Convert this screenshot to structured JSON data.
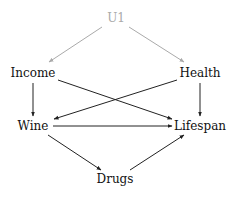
{
  "diagram": {
    "type": "causal-dag",
    "nodes": [
      {
        "id": "U1",
        "label": "U1",
        "x": 116,
        "y": 18,
        "color": "#aaaaaa",
        "latent": true
      },
      {
        "id": "Income",
        "label": "Income",
        "x": 33,
        "y": 73,
        "color": "#111111"
      },
      {
        "id": "Health",
        "label": "Health",
        "x": 200,
        "y": 73,
        "color": "#111111"
      },
      {
        "id": "Wine",
        "label": "Wine",
        "x": 33,
        "y": 126,
        "color": "#111111"
      },
      {
        "id": "Lifespan",
        "label": "Lifespan",
        "x": 200,
        "y": 126,
        "color": "#111111"
      },
      {
        "id": "Drugs",
        "label": "Drugs",
        "x": 115,
        "y": 179,
        "color": "#111111"
      }
    ],
    "edges": [
      {
        "from": "U1",
        "to": "Income",
        "x1": 102,
        "y1": 27,
        "x2": 49,
        "y2": 62,
        "color": "#aaaaaa"
      },
      {
        "from": "U1",
        "to": "Health",
        "x1": 129,
        "y1": 27,
        "x2": 184,
        "y2": 62,
        "color": "#aaaaaa"
      },
      {
        "from": "Income",
        "to": "Wine",
        "x1": 33,
        "y1": 83,
        "x2": 33,
        "y2": 116,
        "color": "#222222"
      },
      {
        "from": "Income",
        "to": "Lifespan",
        "x1": 58,
        "y1": 80,
        "x2": 172,
        "y2": 119,
        "color": "#222222"
      },
      {
        "from": "Health",
        "to": "Wine",
        "x1": 177,
        "y1": 80,
        "x2": 54,
        "y2": 119,
        "color": "#222222"
      },
      {
        "from": "Health",
        "to": "Lifespan",
        "x1": 200,
        "y1": 83,
        "x2": 200,
        "y2": 116,
        "color": "#222222"
      },
      {
        "from": "Wine",
        "to": "Lifespan",
        "x1": 53,
        "y1": 126,
        "x2": 172,
        "y2": 126,
        "color": "#222222"
      },
      {
        "from": "Wine",
        "to": "Drugs",
        "x1": 48,
        "y1": 135,
        "x2": 101,
        "y2": 170,
        "color": "#222222"
      },
      {
        "from": "Drugs",
        "to": "Lifespan",
        "x1": 130,
        "y1": 170,
        "x2": 184,
        "y2": 135,
        "color": "#222222"
      }
    ]
  }
}
